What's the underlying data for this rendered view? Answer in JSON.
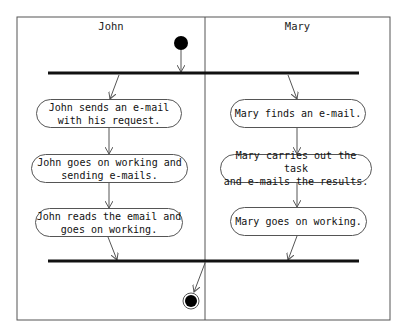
{
  "swimlanes": [
    {
      "name": "John"
    },
    {
      "name": "Mary"
    }
  ],
  "actions": {
    "john": [
      {
        "label": "John sends an e-mail\nwith his request."
      },
      {
        "label": "John goes on working and\nsending e-mails."
      },
      {
        "label": "John reads the email and\ngoes on working."
      }
    ],
    "mary": [
      {
        "label": "Mary finds an e-mail."
      },
      {
        "label": "Mary carries out the task\nand e-mails the results."
      },
      {
        "label": "Mary goes on working."
      }
    ]
  },
  "nodes": {
    "start": "initial-node",
    "fork": "fork-bar",
    "join": "join-bar",
    "end": "final-node"
  },
  "colors": {
    "line": "#555555",
    "bar": "#111111",
    "node": "#000000"
  }
}
